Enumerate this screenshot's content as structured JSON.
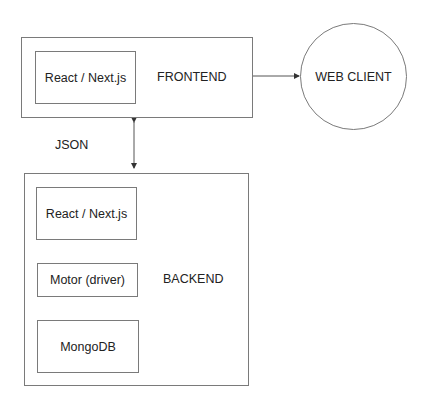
{
  "diagram": {
    "frontend": {
      "label": "FRONTEND",
      "components": [
        "React / Next.js"
      ]
    },
    "backend": {
      "label": "BACKEND",
      "components": [
        "React / Next.js",
        "Motor (driver)",
        "MongoDB"
      ]
    },
    "client": {
      "label": "WEB CLIENT"
    },
    "connections": [
      {
        "from": "frontend",
        "to": "client",
        "label": ""
      },
      {
        "from": "frontend",
        "to": "backend",
        "label": "JSON",
        "bidirectional": true
      }
    ],
    "colors": {
      "stroke": "#7a7a7a",
      "text": "#222222",
      "background": "#ffffff"
    }
  }
}
